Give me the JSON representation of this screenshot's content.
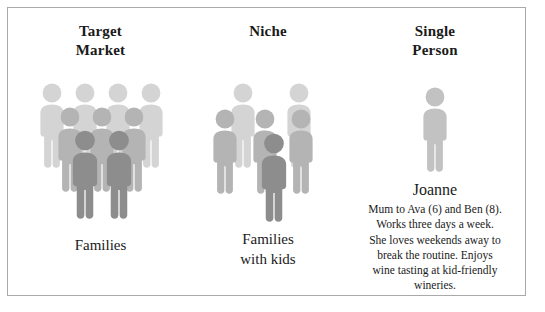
{
  "diagram": {
    "columns": [
      {
        "id": "target-market",
        "heading_line1": "Target",
        "heading_line2": "Market",
        "caption_line1": "Families",
        "caption_line2": "",
        "icon": "people-group-icon"
      },
      {
        "id": "niche",
        "heading_line1": "Niche",
        "heading_line2": "",
        "caption_line1": "Families",
        "caption_line2": "with kids",
        "icon": "people-group-icon"
      },
      {
        "id": "single-person",
        "heading_line1": "Single",
        "heading_line2": "Person",
        "caption_line1": "",
        "caption_line2": "",
        "icon": "person-icon"
      }
    ],
    "persona": {
      "name": "Joanne",
      "description_lines": [
        "Mum to Ava (6) and Ben (8).",
        "Works three days a week.",
        "She loves weekends away to",
        "break the routine. Enjoys",
        "wine tasting at kid-friendly",
        "wineries."
      ]
    },
    "colors": {
      "figure_back": "#d4d4d4",
      "figure_middle": "#b4b4b4",
      "figure_front": "#8d8d8d",
      "figure_single": "#c2c2c2",
      "border": "#a9a9a9",
      "background": "#ffffff",
      "text": "#1a1a1a"
    }
  }
}
